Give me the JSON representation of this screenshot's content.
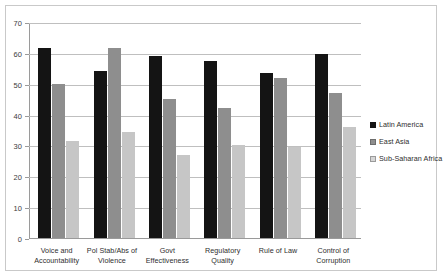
{
  "chart_data": {
    "type": "bar",
    "title": "",
    "xlabel": "",
    "ylabel": "",
    "ylim": [
      0,
      70
    ],
    "ytick_labels": [
      "0",
      "10",
      "20",
      "30",
      "40",
      "50",
      "60",
      "70"
    ],
    "ytick_values": [
      0,
      10,
      20,
      30,
      40,
      50,
      60,
      70
    ],
    "grid": true,
    "legend_position": "right",
    "categories": [
      "Voice and Accountability",
      "Pol Stab/Abs of Violence",
      "Govt Effectiveness",
      "Regulatory Quality",
      "Rule of Law",
      "Control of Corruption"
    ],
    "series": [
      {
        "name": "Latin America",
        "color": "#141414",
        "values": [
          61.5,
          54,
          59,
          57.5,
          53.5,
          59.5
        ]
      },
      {
        "name": "East Asia",
        "color": "#8e8e8e",
        "values": [
          50,
          61.5,
          45,
          42,
          52,
          47
        ]
      },
      {
        "name": "Sub-Saharan Africa",
        "color": "#c6c6c6",
        "values": [
          31.5,
          34.5,
          27,
          30,
          29.5,
          36
        ]
      }
    ]
  },
  "legend": {
    "items": [
      {
        "label": "Latin America"
      },
      {
        "label": "East Asia"
      },
      {
        "label": "Sub-Saharan Africa"
      }
    ]
  }
}
